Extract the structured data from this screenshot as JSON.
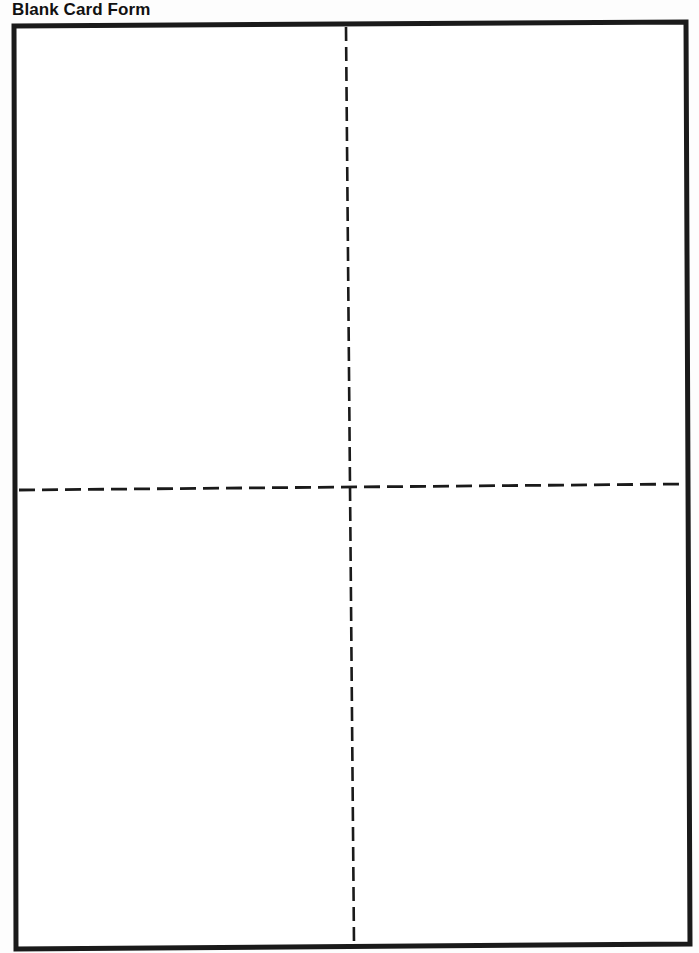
{
  "page": {
    "title": "Blank Card Form"
  },
  "form": {
    "border_color": "#1a1a1a",
    "background": "#ffffff",
    "panels": [
      {
        "id": "top-left",
        "content": ""
      },
      {
        "id": "top-right",
        "content": ""
      },
      {
        "id": "bottom-left",
        "content": ""
      },
      {
        "id": "bottom-right",
        "content": ""
      }
    ],
    "fold_lines": {
      "vertical": "dashed",
      "horizontal": "dashed"
    }
  }
}
